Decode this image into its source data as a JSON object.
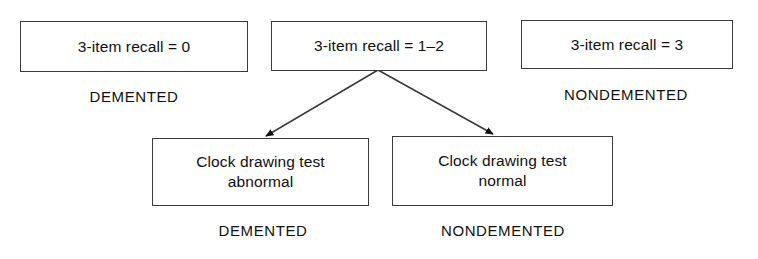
{
  "diagram": {
    "line_color": "#3a3a3a",
    "text_color": "#111111",
    "background": "#ffffff",
    "nodes": {
      "recall_0": {
        "text": "3-item recall = 0"
      },
      "recall_1_2": {
        "text": "3-item recall = 1–2"
      },
      "recall_3": {
        "text": "3-item recall = 3"
      },
      "clock_abnormal": {
        "text": "Clock drawing test\nabnormal"
      },
      "clock_normal": {
        "text": "Clock drawing test\nnormal"
      }
    },
    "outcomes": {
      "recall_0": "DEMENTED",
      "recall_3": "NONDEMENTED",
      "clock_abnormal": "DEMENTED",
      "clock_normal": "NONDEMENTED"
    },
    "edges": [
      {
        "name": "edge-to-clock-abnormal",
        "from": "recall_1_2",
        "to": "clock_abnormal",
        "x1": 378,
        "y1": 70,
        "x2": 266,
        "y2": 136
      },
      {
        "name": "edge-to-clock-normal",
        "from": "recall_1_2",
        "to": "clock_normal",
        "x1": 378,
        "y1": 70,
        "x2": 493,
        "y2": 134
      }
    ]
  }
}
